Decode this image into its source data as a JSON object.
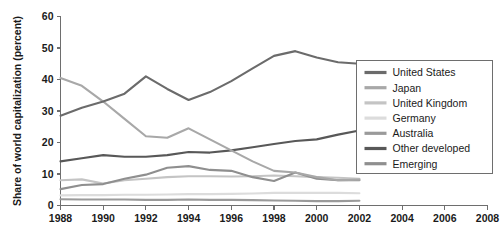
{
  "chart_data": {
    "type": "line",
    "title": "",
    "xlabel": "",
    "ylabel": "Share of world capitalization (percent)",
    "xlim": [
      1988,
      2008
    ],
    "ylim": [
      0,
      60
    ],
    "xticks": [
      1988,
      1990,
      1992,
      1994,
      1996,
      1998,
      2000,
      2002,
      2004,
      2006,
      2008
    ],
    "xtick_labels": [
      "1988",
      "1990",
      "1992",
      "1994",
      "1996",
      "1998",
      "2000",
      "2002",
      "2004",
      "2006",
      "2008"
    ],
    "yticks": [
      0,
      10,
      20,
      30,
      40,
      50,
      60
    ],
    "ytick_labels": [
      "0",
      "10",
      "20",
      "30",
      "40",
      "50",
      "60"
    ],
    "grid": false,
    "legend_position": "right",
    "x": [
      1988,
      1989,
      1990,
      1991,
      1992,
      1993,
      1994,
      1995,
      1996,
      1997,
      1998,
      1999,
      2000,
      2001,
      2002
    ],
    "series": [
      {
        "name": "United States",
        "color": "#6b6b6b",
        "values": [
          28.5,
          31.0,
          33.0,
          35.5,
          41.0,
          37.0,
          33.5,
          36.0,
          39.5,
          43.5,
          47.5,
          49.0,
          47.0,
          45.5,
          45.0
        ]
      },
      {
        "name": "Japan",
        "color": "#a8a8a8",
        "values": [
          40.5,
          38.0,
          33.0,
          27.5,
          22.0,
          21.5,
          24.5,
          21.0,
          17.5,
          14.0,
          11.0,
          10.5,
          9.0,
          8.0,
          8.2
        ]
      },
      {
        "name": "United Kingdom",
        "color": "#c4c4c4",
        "values": [
          8.0,
          8.3,
          7.0,
          8.0,
          8.5,
          9.0,
          9.3,
          9.3,
          9.2,
          9.3,
          9.5,
          9.3,
          9.0,
          8.8,
          8.5
        ]
      },
      {
        "name": "Germany",
        "color": "#dcdcdc",
        "values": [
          3.2,
          3.3,
          3.3,
          3.4,
          3.4,
          3.5,
          3.6,
          3.6,
          3.7,
          3.8,
          4.0,
          4.0,
          4.0,
          4.0,
          3.9
        ]
      },
      {
        "name": "Australia",
        "color": "#9a9a9a",
        "values": [
          2.0,
          1.9,
          1.9,
          1.9,
          1.8,
          1.8,
          1.9,
          1.8,
          1.8,
          1.7,
          1.6,
          1.5,
          1.4,
          1.4,
          1.5
        ]
      },
      {
        "name": "Other developed",
        "color": "#585858",
        "values": [
          14.0,
          15.0,
          16.0,
          15.5,
          15.5,
          16.0,
          17.0,
          16.8,
          17.5,
          18.5,
          19.5,
          20.5,
          21.0,
          22.5,
          23.8
        ]
      },
      {
        "name": "Emerging",
        "color": "#8f8f8f",
        "values": [
          5.2,
          6.5,
          6.8,
          8.5,
          9.8,
          12.0,
          12.5,
          11.3,
          11.0,
          9.0,
          7.8,
          10.5,
          8.5,
          8.0,
          8.0
        ]
      }
    ],
    "legend_entries": [
      "United States",
      "Japan",
      "United Kingdom",
      "Germany",
      "Australia",
      "Other developed",
      "Emerging"
    ]
  }
}
